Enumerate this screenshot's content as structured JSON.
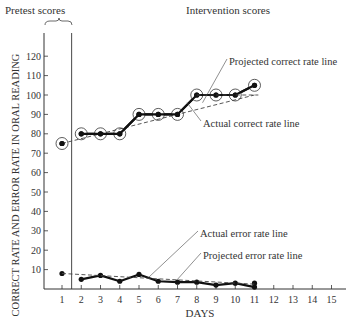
{
  "chart_data": {
    "type": "line",
    "title": "",
    "xlabel": "DAYS",
    "ylabel": "CORRECT RATE AND ERROR RATE IN ORAL READING",
    "x_ticks": [
      1,
      2,
      3,
      4,
      5,
      6,
      7,
      8,
      9,
      10,
      11,
      12,
      13,
      14,
      15
    ],
    "y_ticks": [
      10,
      20,
      30,
      40,
      50,
      60,
      70,
      80,
      90,
      100,
      110,
      120
    ],
    "xlim": [
      0.5,
      15.5
    ],
    "ylim": [
      0,
      125
    ],
    "grid": false,
    "phase_labels": {
      "pretest": "Pretest scores",
      "intervention": "Intervention scores",
      "phase_line_x": 1.5
    },
    "series": [
      {
        "name": "Actual correct rate line",
        "style": "solid-thick-circled",
        "x": [
          1,
          2,
          3,
          4,
          5,
          6,
          7,
          8,
          9,
          10,
          11
        ],
        "values": [
          75,
          80,
          80,
          80,
          90,
          90,
          90,
          100,
          100,
          100,
          105
        ],
        "connect_from": 2
      },
      {
        "name": "Projected correct rate line",
        "style": "dashed",
        "x": [
          1,
          11
        ],
        "values": [
          75,
          100
        ]
      },
      {
        "name": "Actual error rate line",
        "style": "solid-thick-dots",
        "x": [
          1,
          2,
          3,
          4,
          5,
          6,
          7,
          8,
          9,
          10,
          11
        ],
        "values": [
          8,
          5,
          7,
          4,
          7.5,
          4,
          3.5,
          3.5,
          2,
          3,
          1
        ],
        "connect_from": 2,
        "extra_points": [
          {
            "x": 11,
            "y": 3
          }
        ]
      },
      {
        "name": "Projected error rate line",
        "style": "dashed",
        "x": [
          1,
          11
        ],
        "values": [
          8,
          2.5
        ]
      }
    ],
    "annotations": [
      {
        "text": "Projected correct rate line",
        "label_x": 226,
        "label_y": 65,
        "target_day": 8.3,
        "target_y": 96
      },
      {
        "text": "Actual correct rate line",
        "label_x": 200,
        "label_y": 127,
        "target_day": 7.5,
        "target_y": 96
      },
      {
        "text": "Actual error rate line",
        "label_x": 197,
        "label_y": 237,
        "target_day": 5.5,
        "target_y": 6
      },
      {
        "text": "Projected error rate line",
        "label_x": 200,
        "label_y": 259,
        "target_day": 7,
        "target_y": 5
      }
    ]
  }
}
